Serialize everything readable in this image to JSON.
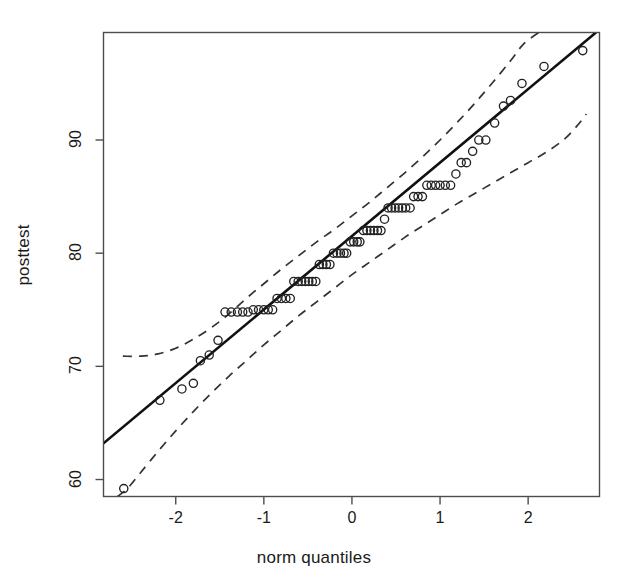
{
  "chart_data": {
    "type": "scatter",
    "title": "",
    "subtitle": "",
    "xlabel": "norm quantiles",
    "ylabel": "posttest",
    "xlim": [
      -2.82,
      2.81
    ],
    "ylim": [
      58.5,
      99.5
    ],
    "xticks": [
      -2,
      -1,
      0,
      1,
      2
    ],
    "xticklabels": [
      "-2",
      "-1",
      "0",
      "1",
      "2"
    ],
    "yticks": [
      60,
      70,
      80,
      90
    ],
    "yticklabels": [
      "60",
      "70",
      "80",
      "90"
    ],
    "grid": false,
    "legend": null,
    "box": true,
    "point_marker": "open-circle",
    "point_color": "#222222",
    "line_color": "#111111",
    "envelope_color": "#333333",
    "envelope_style": "dashed",
    "background_color": "#ffffff",
    "reference_line": {
      "label": "fitted normal reference line",
      "slope_y_per_quantile": 6.52,
      "intercept_y_at_zero": 82.2,
      "x_start": -2.82,
      "y_start": 63.2,
      "x_end": 2.77,
      "y_end": 99.5
    },
    "confidence_envelope": {
      "label": "pointwise 95% confidence envelope",
      "upper": [
        [
          -2.6,
          70.9
        ],
        [
          -2.4,
          70.9
        ],
        [
          -2.2,
          71.1
        ],
        [
          -2.0,
          71.6
        ],
        [
          -1.8,
          72.4
        ],
        [
          -1.6,
          73.4
        ],
        [
          -1.4,
          74.6
        ],
        [
          -1.2,
          76.0
        ],
        [
          -1.0,
          77.3
        ],
        [
          -0.8,
          78.6
        ],
        [
          -0.6,
          79.8
        ],
        [
          -0.4,
          81.0
        ],
        [
          -0.2,
          82.1
        ],
        [
          0.0,
          83.3
        ],
        [
          0.2,
          84.5
        ],
        [
          0.4,
          85.8
        ],
        [
          0.6,
          87.1
        ],
        [
          0.8,
          88.5
        ],
        [
          1.0,
          90.0
        ],
        [
          1.2,
          91.6
        ],
        [
          1.4,
          93.3
        ],
        [
          1.6,
          95.1
        ],
        [
          1.8,
          97.0
        ],
        [
          1.95,
          98.5
        ],
        [
          2.12,
          99.5
        ]
      ],
      "lower": [
        [
          -2.66,
          58.5
        ],
        [
          -2.55,
          59.2
        ],
        [
          -2.4,
          60.6
        ],
        [
          -2.2,
          62.5
        ],
        [
          -2.0,
          64.3
        ],
        [
          -1.8,
          66.0
        ],
        [
          -1.6,
          67.6
        ],
        [
          -1.4,
          69.1
        ],
        [
          -1.2,
          70.5
        ],
        [
          -1.0,
          71.9
        ],
        [
          -0.8,
          73.2
        ],
        [
          -0.6,
          74.5
        ],
        [
          -0.4,
          75.7
        ],
        [
          -0.2,
          76.9
        ],
        [
          0.0,
          78.1
        ],
        [
          0.2,
          79.2
        ],
        [
          0.4,
          80.3
        ],
        [
          0.6,
          81.4
        ],
        [
          0.8,
          82.4
        ],
        [
          1.0,
          83.4
        ],
        [
          1.2,
          84.4
        ],
        [
          1.4,
          85.3
        ],
        [
          1.6,
          86.2
        ],
        [
          1.8,
          87.1
        ],
        [
          2.0,
          88.0
        ],
        [
          2.2,
          88.9
        ],
        [
          2.4,
          90.0
        ],
        [
          2.55,
          91.2
        ],
        [
          2.66,
          92.3
        ]
      ]
    },
    "points": [
      [
        -2.59,
        59.2
      ],
      [
        -2.18,
        67.0
      ],
      [
        -1.93,
        68.0
      ],
      [
        -1.8,
        68.5
      ],
      [
        -1.72,
        70.5
      ],
      [
        -1.62,
        71.0
      ],
      [
        -1.52,
        72.3
      ],
      [
        -1.44,
        74.8
      ],
      [
        -1.37,
        74.8
      ],
      [
        -1.3,
        74.8
      ],
      [
        -1.24,
        74.8
      ],
      [
        -1.18,
        74.8
      ],
      [
        -1.12,
        75.0
      ],
      [
        -1.06,
        75.0
      ],
      [
        -1.0,
        75.0
      ],
      [
        -0.95,
        75.0
      ],
      [
        -0.9,
        75.0
      ],
      [
        -0.85,
        76.0
      ],
      [
        -0.8,
        76.0
      ],
      [
        -0.75,
        76.0
      ],
      [
        -0.7,
        76.0
      ],
      [
        -0.66,
        77.5
      ],
      [
        -0.61,
        77.5
      ],
      [
        -0.57,
        77.5
      ],
      [
        -0.53,
        77.5
      ],
      [
        -0.49,
        77.5
      ],
      [
        -0.45,
        77.5
      ],
      [
        -0.41,
        77.5
      ],
      [
        -0.37,
        79.0
      ],
      [
        -0.33,
        79.0
      ],
      [
        -0.29,
        79.0
      ],
      [
        -0.25,
        79.0
      ],
      [
        -0.21,
        80.0
      ],
      [
        -0.17,
        80.0
      ],
      [
        -0.13,
        80.0
      ],
      [
        -0.09,
        80.0
      ],
      [
        -0.06,
        80.0
      ],
      [
        -0.02,
        81.0
      ],
      [
        0.02,
        81.0
      ],
      [
        0.06,
        81.0
      ],
      [
        0.09,
        81.0
      ],
      [
        0.13,
        82.0
      ],
      [
        0.17,
        82.0
      ],
      [
        0.21,
        82.0
      ],
      [
        0.25,
        82.0
      ],
      [
        0.29,
        82.0
      ],
      [
        0.33,
        82.0
      ],
      [
        0.37,
        83.0
      ],
      [
        0.41,
        84.0
      ],
      [
        0.45,
        84.0
      ],
      [
        0.49,
        84.0
      ],
      [
        0.53,
        84.0
      ],
      [
        0.57,
        84.0
      ],
      [
        0.61,
        84.0
      ],
      [
        0.66,
        84.0
      ],
      [
        0.7,
        85.0
      ],
      [
        0.75,
        85.0
      ],
      [
        0.8,
        85.0
      ],
      [
        0.85,
        86.0
      ],
      [
        0.9,
        86.0
      ],
      [
        0.95,
        86.0
      ],
      [
        1.0,
        86.0
      ],
      [
        1.06,
        86.0
      ],
      [
        1.12,
        86.0
      ],
      [
        1.18,
        87.0
      ],
      [
        1.24,
        88.0
      ],
      [
        1.3,
        88.0
      ],
      [
        1.37,
        89.0
      ],
      [
        1.44,
        90.0
      ],
      [
        1.52,
        90.0
      ],
      [
        1.62,
        91.5
      ],
      [
        1.72,
        93.0
      ],
      [
        1.8,
        93.5
      ],
      [
        1.93,
        95.0
      ],
      [
        2.18,
        96.5
      ],
      [
        2.62,
        97.9
      ]
    ]
  },
  "axes": {
    "xlabel": "norm quantiles",
    "ylabel": "posttest"
  }
}
